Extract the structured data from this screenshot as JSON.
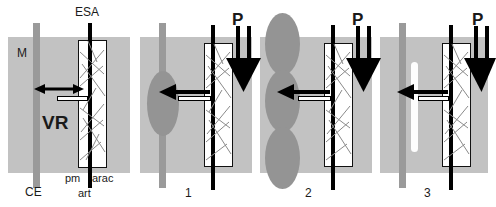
{
  "figure": {
    "panels": [
      {
        "id": "panel-reference",
        "number": "",
        "labels": {
          "esa": "ESA",
          "m": "M",
          "ce": "CE",
          "vr": "VR",
          "pm": "pm",
          "arac": "arac",
          "art": "art"
        }
      },
      {
        "id": "panel-1",
        "number": "1",
        "labels": {
          "p": "P"
        }
      },
      {
        "id": "panel-2",
        "number": "2",
        "labels": {
          "p": "P"
        }
      },
      {
        "id": "panel-3",
        "number": "3",
        "labels": {
          "p": "P"
        }
      }
    ],
    "colors": {
      "tissue": "#c2c2c2",
      "ce_bar": "#9a9a9a",
      "bleb": "#949494",
      "capsule": "#fdfdfd",
      "line": "#000000",
      "background": "#ffffff"
    }
  }
}
